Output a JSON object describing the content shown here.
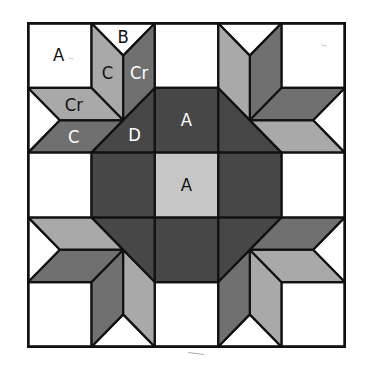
{
  "diagram": {
    "type": "quilt-block",
    "grid": {
      "cols": 5,
      "rows": 5
    },
    "colors": {
      "white": "#ffffff",
      "light": "#a9a9a9",
      "medium": "#707070",
      "dark": "#474747",
      "center": "#c6c6c6",
      "outline": "#111111"
    },
    "labels": [
      {
        "text": "A",
        "x": 0.48,
        "y": 0.5,
        "color": "#111111"
      },
      {
        "text": "B",
        "x": 1.5,
        "y": 0.22,
        "color": "#111111"
      },
      {
        "text": "C",
        "x": 1.25,
        "y": 0.78,
        "color": "#111111"
      },
      {
        "text": "Cr",
        "x": 1.75,
        "y": 0.78,
        "color": "#ffffff"
      },
      {
        "text": "Cr",
        "x": 0.72,
        "y": 1.27,
        "color": "#111111"
      },
      {
        "text": "C",
        "x": 0.72,
        "y": 1.77,
        "color": "#ffffff"
      },
      {
        "text": "D",
        "x": 1.68,
        "y": 1.73,
        "color": "#ffffff"
      },
      {
        "text": "A",
        "x": 2.5,
        "y": 1.5,
        "color": "#ffffff"
      },
      {
        "text": "A",
        "x": 2.5,
        "y": 2.5,
        "color": "#111111"
      }
    ]
  }
}
